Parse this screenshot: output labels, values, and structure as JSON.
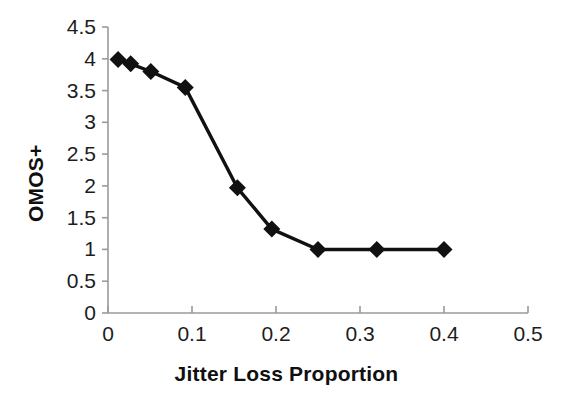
{
  "chart_data": {
    "type": "line",
    "title": "",
    "subtitle": "",
    "xlabel": "Jitter Loss Proportion",
    "ylabel": "OMOS+",
    "xlim": [
      0,
      0.5
    ],
    "ylim": [
      0,
      4.5
    ],
    "xticks": [
      0,
      0.1,
      0.2,
      0.3,
      0.4,
      0.5
    ],
    "xtick_labels": [
      "0",
      "0.1",
      "0.2",
      "0.3",
      "0.4",
      "0.5"
    ],
    "yticks": [
      0,
      0.5,
      1,
      1.5,
      2,
      2.5,
      3,
      3.5,
      4,
      4.5
    ],
    "ytick_labels": [
      "0",
      "0.5",
      "1",
      "1.5",
      "2",
      "2.5",
      "3",
      "3.5",
      "4",
      "4.5"
    ],
    "grid": false,
    "legend": false,
    "legend_position": "none",
    "marker": "diamond",
    "marker_color": "#111111",
    "line_color": "#111111",
    "axis_color": "#9a9a9a",
    "background": "#ffffff",
    "x": [
      0.012,
      0.027,
      0.051,
      0.092,
      0.154,
      0.195,
      0.25,
      0.32,
      0.4
    ],
    "values": [
      3.99,
      3.92,
      3.8,
      3.55,
      1.97,
      1.32,
      1.0,
      1.0,
      1.0
    ],
    "series": [
      {
        "name": "OMOS+",
        "points": [
          {
            "x": 0.012,
            "y": 3.99
          },
          {
            "x": 0.027,
            "y": 3.92
          },
          {
            "x": 0.051,
            "y": 3.8
          },
          {
            "x": 0.092,
            "y": 3.55
          },
          {
            "x": 0.154,
            "y": 1.97
          },
          {
            "x": 0.195,
            "y": 1.32
          },
          {
            "x": 0.25,
            "y": 1.0
          },
          {
            "x": 0.32,
            "y": 1.0
          },
          {
            "x": 0.4,
            "y": 1.0
          }
        ]
      }
    ]
  },
  "axes": {
    "x_title": "Jitter Loss Proportion",
    "y_title": "OMOS+"
  }
}
